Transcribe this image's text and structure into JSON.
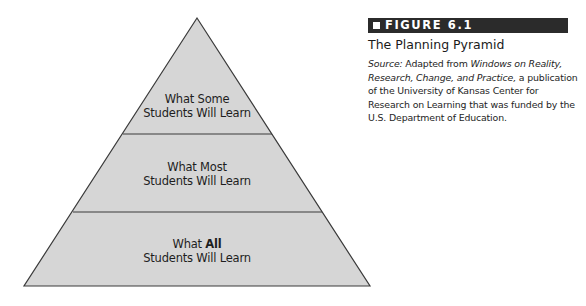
{
  "figure": {
    "number_label": "FIGURE 6.1",
    "title": "The Planning Pyramid",
    "source": {
      "lead": "Source:",
      "text_1": " Adapted from ",
      "italic_title": "Windows on Reality, Research, Change, and Practice,",
      "text_2": " a publication of the University of Kansas Center for Research on Learning that was funded by the U.S. Department of Education."
    }
  },
  "pyramid": {
    "fill_color": "#d6d6d6",
    "stroke_color": "#3a3a3a",
    "tiers": [
      {
        "position": "top",
        "line1_prefix": "What Some",
        "line1_emphasis": "",
        "line2": "Students Will Learn"
      },
      {
        "position": "middle",
        "line1_prefix": "What Most",
        "line1_emphasis": "",
        "line2": "Students Will Learn"
      },
      {
        "position": "bottom",
        "line1_prefix": "What ",
        "line1_emphasis": "All",
        "line2": "Students Will Learn"
      }
    ]
  }
}
